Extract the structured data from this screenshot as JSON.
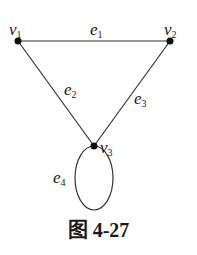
{
  "diagram": {
    "type": "graph",
    "vertices": [
      {
        "id": "v1",
        "label": "v",
        "sub": "1"
      },
      {
        "id": "v2",
        "label": "v",
        "sub": "2"
      },
      {
        "id": "v3",
        "label": "v",
        "sub": "3"
      }
    ],
    "edges": [
      {
        "id": "e1",
        "label": "e",
        "sub": "1",
        "from": "v1",
        "to": "v2"
      },
      {
        "id": "e2",
        "label": "e",
        "sub": "2",
        "from": "v1",
        "to": "v3"
      },
      {
        "id": "e3",
        "label": "e",
        "sub": "3",
        "from": "v2",
        "to": "v3"
      },
      {
        "id": "e4",
        "label": "e",
        "sub": "4",
        "from": "v3",
        "to": "v3",
        "loop": true
      }
    ],
    "colors": {
      "stroke": "#333333",
      "vertex": "#111111"
    }
  },
  "caption": "图 4-27"
}
